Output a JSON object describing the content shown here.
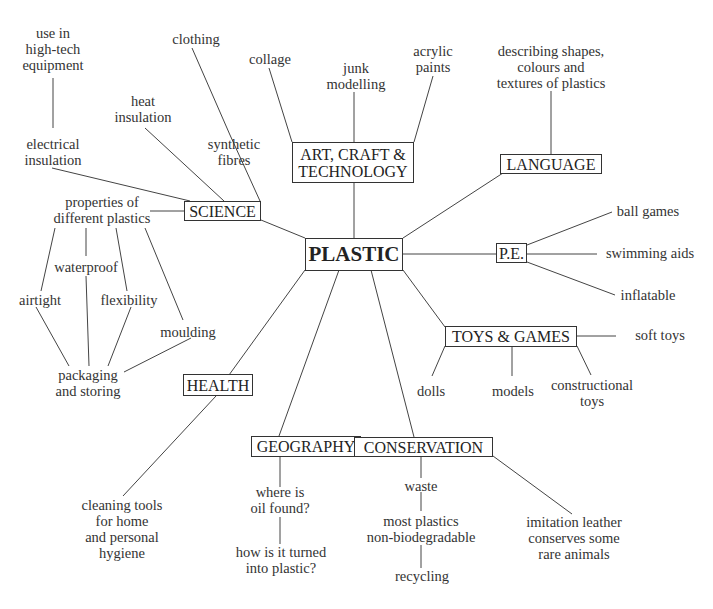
{
  "center": {
    "label": "PLASTIC"
  },
  "topics": {
    "art": {
      "lines": [
        "ART, CRAFT &",
        "TECHNOLOGY"
      ]
    },
    "science": {
      "label": "SCIENCE"
    },
    "language": {
      "label": "LANGUAGE"
    },
    "pe": {
      "label": "P.E."
    },
    "toys": {
      "label": "TOYS & GAMES"
    },
    "health": {
      "label": "HEALTH"
    },
    "geography": {
      "label": "GEOGRAPHY"
    },
    "conservation": {
      "label": "CONSERVATION"
    }
  },
  "leaves": {
    "use_high_tech": [
      "use in",
      "high-tech",
      "equipment"
    ],
    "electrical_insulation": [
      "electrical",
      "insulation"
    ],
    "heat_insulation": [
      "heat",
      "insulation"
    ],
    "clothing": [
      "clothing"
    ],
    "synthetic_fibres": [
      "synthetic",
      "fibres"
    ],
    "properties": [
      "properties of",
      "different plastics"
    ],
    "waterproof": [
      "waterproof"
    ],
    "airtight": [
      "airtight"
    ],
    "flexibility": [
      "flexibility"
    ],
    "moulding": [
      "moulding"
    ],
    "packaging": [
      "packaging",
      "and storing"
    ],
    "collage": [
      "collage"
    ],
    "junk_modelling": [
      "junk",
      "modelling"
    ],
    "acrylic_paints": [
      "acrylic",
      "paints"
    ],
    "describing": [
      "describing shapes,",
      "colours and",
      "textures of plastics"
    ],
    "ball_games": [
      "ball games"
    ],
    "swimming_aids": [
      "swimming aids"
    ],
    "inflatable": [
      "inflatable"
    ],
    "soft_toys": [
      "soft toys"
    ],
    "dolls": [
      "dolls"
    ],
    "models": [
      "models"
    ],
    "constructional_toys": [
      "constructional",
      "toys"
    ],
    "cleaning_tools": [
      "cleaning tools",
      "for home",
      "and personal",
      "hygiene"
    ],
    "where_oil": [
      "where is",
      "oil found?"
    ],
    "how_turned": [
      "how is it turned",
      "into plastic?"
    ],
    "waste": [
      "waste"
    ],
    "non_biodegradable": [
      "most plastics",
      "non-biodegradable"
    ],
    "recycling": [
      "recycling"
    ],
    "imitation_leather": [
      "imitation leather",
      "conserves some",
      "rare animals"
    ]
  }
}
